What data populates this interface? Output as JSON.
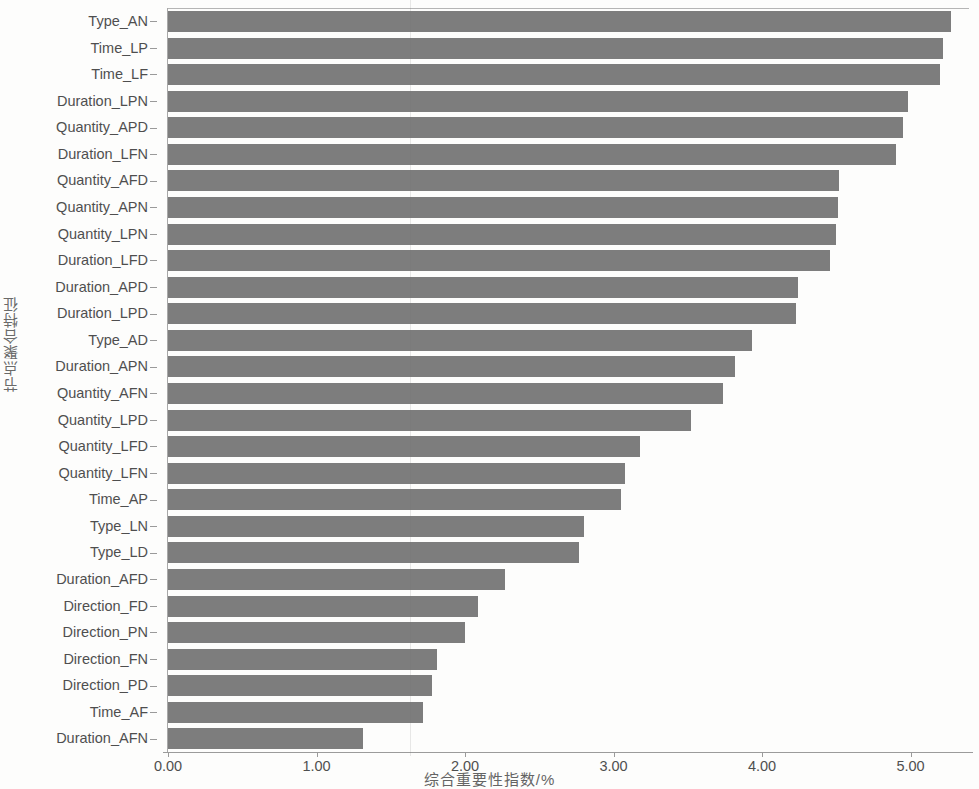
{
  "chart_data": {
    "type": "bar",
    "orientation": "horizontal",
    "title": "",
    "xlabel": "综合重要性指数/%",
    "ylabel": "节点聚合特征",
    "xlim": [
      0,
      5.4
    ],
    "ylim": null,
    "grid": false,
    "legend": null,
    "bar_color": "#7d7d7d",
    "x_ticks": [
      "0.00",
      "1.00",
      "2.00",
      "3.00",
      "4.00",
      "5.00"
    ],
    "x_tick_values": [
      0,
      1,
      2,
      3,
      4,
      5
    ],
    "categories": [
      "Type_AN",
      "Time_LP",
      "Time_LF",
      "Duration_LPN",
      "Quantity_APD",
      "Duration_LFN",
      "Quantity_AFD",
      "Quantity_APN",
      "Quantity_LPN",
      "Duration_LFD",
      "Duration_APD",
      "Duration_LPD",
      "Type_AD",
      "Duration_APN",
      "Quantity_AFN",
      "Quantity_LPD",
      "Quantity_LFD",
      "Quantity_LFN",
      "Time_AP",
      "Type_LN",
      "Type_LD",
      "Duration_AFD",
      "Direction_FD",
      "Direction_PN",
      "Direction_FN",
      "Direction_PD",
      "Time_AF",
      "Duration_AFN"
    ],
    "values": [
      5.27,
      5.22,
      5.2,
      4.98,
      4.95,
      4.9,
      4.52,
      4.51,
      4.5,
      4.46,
      4.24,
      4.23,
      3.93,
      3.82,
      3.74,
      3.52,
      3.18,
      3.08,
      3.05,
      2.8,
      2.77,
      2.27,
      2.09,
      2.0,
      1.81,
      1.78,
      1.72,
      1.31
    ]
  }
}
